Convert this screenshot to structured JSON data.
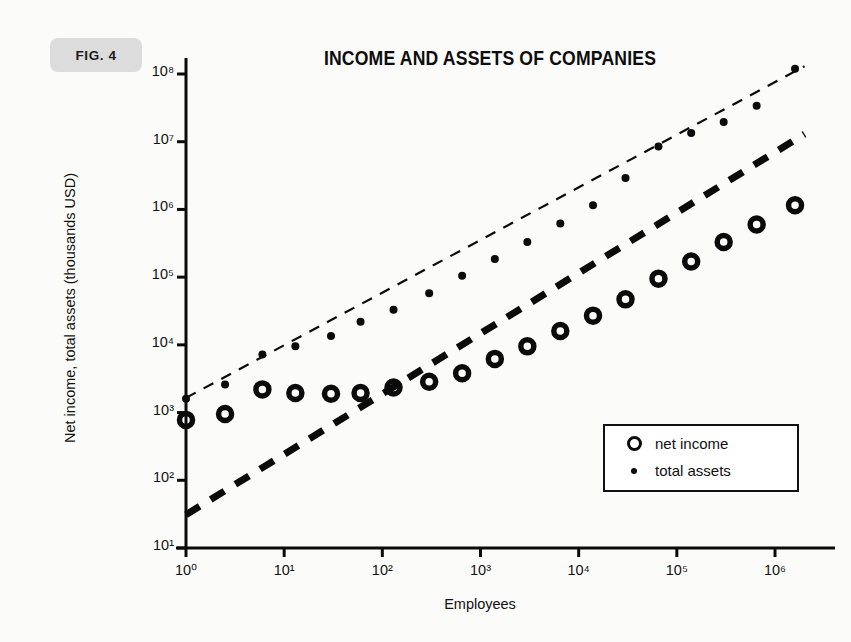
{
  "figure": {
    "badge": "FIG. 4",
    "title": "INCOME AND ASSETS OF COMPANIES"
  },
  "axes": {
    "x": {
      "label": "Employees",
      "ticks": [
        "10⁰",
        "10¹",
        "10²",
        "10³",
        "10⁴",
        "10⁵",
        "10⁶"
      ],
      "tick_exponents": [
        0,
        1,
        2,
        3,
        4,
        5,
        6
      ],
      "scale": "log",
      "range": [
        1,
        2000000
      ]
    },
    "y": {
      "label": "Net income, total assets (thousands USD)",
      "ticks": [
        "10¹",
        "10²",
        "10³",
        "10⁴",
        "10⁵",
        "10⁶",
        "10⁷",
        "10⁸"
      ],
      "tick_exponents": [
        1,
        2,
        3,
        4,
        5,
        6,
        7,
        8
      ],
      "scale": "log",
      "range": [
        10,
        100000000
      ]
    }
  },
  "legend": {
    "position": "inside-bottom-right",
    "entries": [
      {
        "label": "net income",
        "marker": "open-ring"
      },
      {
        "label": "total assets",
        "marker": "filled-dot"
      }
    ]
  },
  "colors": {
    "ink": "#0b0b0b",
    "paper": "#fbfbfa",
    "badge_bg": "#dcdcdc"
  },
  "chart_data": {
    "type": "scatter",
    "title": "INCOME AND ASSETS OF COMPANIES",
    "xlabel": "Employees",
    "ylabel": "Net income, total assets (thousands USD)",
    "xscale": "log",
    "yscale": "log",
    "xlim": [
      1,
      2000000
    ],
    "ylim": [
      10,
      100000000
    ],
    "grid": false,
    "legend_position": "inside-bottom-right",
    "series": [
      {
        "name": "net income",
        "marker": "open-ring",
        "x": [
          1,
          2.5,
          6,
          13,
          30,
          60,
          130,
          300,
          650,
          1400,
          3000,
          6500,
          14000,
          30000,
          65000,
          140000,
          300000,
          650000,
          1600000
        ],
        "y": [
          780,
          950,
          2200,
          1950,
          1900,
          1950,
          2350,
          2850,
          3800,
          6200,
          9500,
          16000,
          27000,
          47000,
          95000,
          170000,
          330000,
          600000,
          1150000
        ]
      },
      {
        "name": "total assets",
        "marker": "filled-dot",
        "x": [
          1,
          2.5,
          6,
          13,
          30,
          60,
          130,
          300,
          650,
          1400,
          3000,
          6500,
          14000,
          30000,
          65000,
          140000,
          300000,
          650000,
          1600000
        ],
        "y": [
          1600,
          2600,
          7200,
          9500,
          13500,
          22000,
          33000,
          58000,
          105000,
          185000,
          330000,
          620000,
          1150000,
          2900000,
          8500000,
          13500000,
          19500000,
          34000000,
          120000000
        ]
      }
    ],
    "trendlines": [
      {
        "name": "total-assets-trend",
        "style": "dashed-thin",
        "x": [
          1,
          2000000
        ],
        "y": [
          1650,
          130000000
        ]
      },
      {
        "name": "net-income-trend",
        "style": "dashed-thick",
        "x": [
          1,
          2000000
        ],
        "y": [
          31,
          13000000
        ]
      }
    ]
  }
}
